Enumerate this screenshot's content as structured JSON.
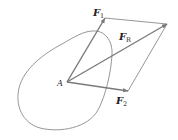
{
  "diagram": {
    "type": "parallelogram-law-of-forces",
    "point": {
      "label": "A",
      "x": 67,
      "y": 82
    },
    "vectors": [
      {
        "name": "F1",
        "symbol": "F",
        "subscript": "1",
        "from": [
          67,
          82
        ],
        "to": [
          105,
          18
        ]
      },
      {
        "name": "F2",
        "symbol": "F",
        "subscript": "2",
        "from": [
          67,
          82
        ],
        "to": [
          128,
          91
        ]
      },
      {
        "name": "FR",
        "symbol": "F",
        "subscript": "R",
        "from": [
          67,
          82
        ],
        "to": [
          167,
          24
        ]
      }
    ],
    "parallelogram_corner": [
      167,
      24
    ],
    "colors": {
      "vector": "#7a7a7a",
      "outline": "#8a8a8a",
      "construction": "#8a8a8a",
      "text": "#222222"
    }
  }
}
